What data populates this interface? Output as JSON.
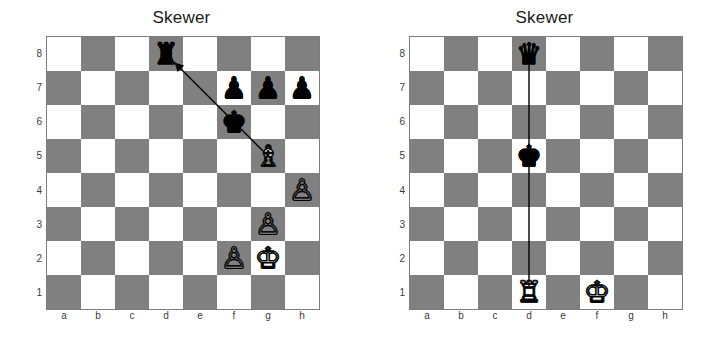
{
  "diagrams": [
    {
      "id": "left",
      "title": "Skewer",
      "files": [
        "a",
        "b",
        "c",
        "d",
        "e",
        "f",
        "g",
        "h"
      ],
      "ranks": [
        "8",
        "7",
        "6",
        "5",
        "4",
        "3",
        "2",
        "1"
      ],
      "light_square_color": "#ffffff",
      "dark_square_color": "#808080",
      "border_color": "#7d7d7d",
      "pieces": [
        {
          "square": "d8",
          "color": "black",
          "type": "rook",
          "glyph": "♜"
        },
        {
          "square": "f7",
          "color": "black",
          "type": "pawn",
          "glyph": "♟"
        },
        {
          "square": "g7",
          "color": "black",
          "type": "pawn",
          "glyph": "♟"
        },
        {
          "square": "h7",
          "color": "black",
          "type": "pawn",
          "glyph": "♟"
        },
        {
          "square": "f6",
          "color": "black",
          "type": "king",
          "glyph": "♚"
        },
        {
          "square": "g5",
          "color": "white",
          "type": "bishop",
          "glyph": "♗"
        },
        {
          "square": "h4",
          "color": "white",
          "type": "pawn",
          "glyph": "♙"
        },
        {
          "square": "g3",
          "color": "white",
          "type": "pawn",
          "glyph": "♙"
        },
        {
          "square": "f2",
          "color": "white",
          "type": "pawn",
          "glyph": "♙"
        },
        {
          "square": "g2",
          "color": "white",
          "type": "king",
          "glyph": "♔"
        }
      ],
      "marks": [
        {
          "kind": "arrow",
          "from_square": "g5",
          "to_square": "d8",
          "arrowhead_at": "d8",
          "color": "#000000",
          "width": 1.4
        }
      ]
    },
    {
      "id": "right",
      "title": "Skewer",
      "files": [
        "a",
        "b",
        "c",
        "d",
        "e",
        "f",
        "g",
        "h"
      ],
      "ranks": [
        "8",
        "7",
        "6",
        "5",
        "4",
        "3",
        "2",
        "1"
      ],
      "light_square_color": "#ffffff",
      "dark_square_color": "#808080",
      "border_color": "#7d7d7d",
      "pieces": [
        {
          "square": "d8",
          "color": "black",
          "type": "queen",
          "glyph": "♛"
        },
        {
          "square": "d5",
          "color": "black",
          "type": "king",
          "glyph": "♚"
        },
        {
          "square": "d1",
          "color": "white",
          "type": "rook",
          "glyph": "♖"
        },
        {
          "square": "f1",
          "color": "white",
          "type": "king",
          "glyph": "♔"
        }
      ],
      "marks": [
        {
          "kind": "line",
          "from_square": "d8",
          "to_square": "d1",
          "arrowhead_at": null,
          "color": "#000000",
          "width": 1.4
        }
      ]
    }
  ]
}
